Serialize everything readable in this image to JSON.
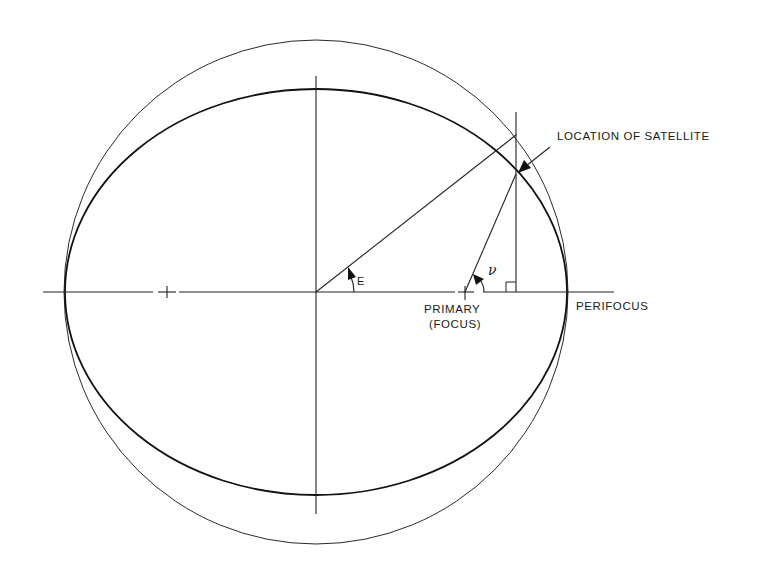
{
  "diagram": {
    "labels": {
      "satellite": "LOCATION OF SATELLITE",
      "primary_line1": "PRIMARY",
      "primary_line2": "(FOCUS)",
      "perifocus": "PERIFOCUS",
      "eccentric_anomaly": "E",
      "true_anomaly": "ν"
    },
    "elements": [
      "auxiliary circle",
      "orbit ellipse",
      "major axis",
      "minor axis",
      "center",
      "empty focus",
      "primary focus",
      "satellite position",
      "perpendicular from satellite to major axis",
      "right-angle marker"
    ],
    "colors": {
      "ink": "#1a1a1a",
      "background": "#ffffff"
    }
  }
}
